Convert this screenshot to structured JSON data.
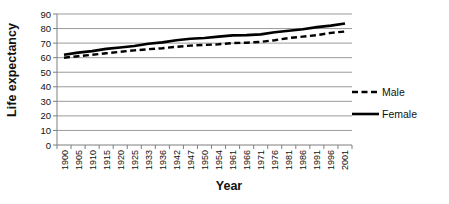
{
  "chart_data": {
    "type": "line",
    "title": "",
    "xlabel": "Year",
    "ylabel": "Life expectancy",
    "ylim": [
      0,
      90
    ],
    "ytick_step": 10,
    "grid": true,
    "legend_position": "right",
    "categories": [
      "1900",
      "1905",
      "1910",
      "1915",
      "1920",
      "1925",
      "1933",
      "1936",
      "1942",
      "1947",
      "1950",
      "1954",
      "1961",
      "1966",
      "1971",
      "1976",
      "1981",
      "1986",
      "1991",
      "1996",
      "2001"
    ],
    "series": [
      {
        "name": "Male",
        "style": "dashed",
        "color": "#000000",
        "values": [
          60,
          61,
          62,
          63,
          64,
          65,
          65.8,
          66.5,
          67.5,
          68.3,
          68.8,
          69.2,
          70,
          70.3,
          70.8,
          72,
          73.5,
          74.5,
          75.5,
          77,
          78
        ]
      },
      {
        "name": "Female",
        "style": "solid",
        "color": "#000000",
        "values": [
          62,
          63.5,
          64.5,
          66,
          67,
          68,
          69.5,
          70.5,
          72,
          73,
          73.5,
          74.5,
          75.3,
          75.5,
          76,
          77.5,
          78.5,
          79.5,
          81,
          82,
          83.5
        ]
      }
    ]
  },
  "colors": {
    "background": "#ffffff",
    "gridline": "#9b9b9b",
    "axis": "#7f7f7f",
    "line": "#000000",
    "text": "#111111"
  }
}
